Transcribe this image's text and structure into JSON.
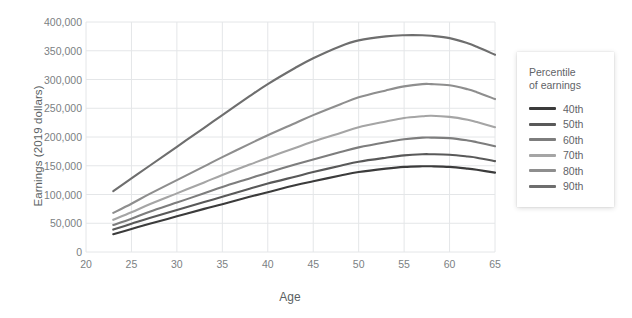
{
  "chart_data": {
    "type": "line",
    "title": "",
    "xlabel": "Age",
    "ylabel": "Earnings (2019 dollars)",
    "xlim": [
      20,
      65
    ],
    "ylim": [
      0,
      400000
    ],
    "xticks": [
      20,
      25,
      30,
      35,
      40,
      45,
      50,
      55,
      60,
      65
    ],
    "yticks": [
      0,
      50000,
      100000,
      150000,
      200000,
      250000,
      300000,
      350000,
      400000
    ],
    "ytick_labels": [
      "0",
      "50,000",
      "100,000",
      "150,000",
      "200,000",
      "250,000",
      "300,000",
      "350,000",
      "400,000"
    ],
    "xtick_labels": [
      "20",
      "25",
      "30",
      "35",
      "40",
      "45",
      "50",
      "55",
      "60",
      "65"
    ],
    "grid": true,
    "legend_position": "right",
    "legend_title": "Percentile of earnings",
    "x": [
      23,
      25,
      27,
      30,
      33,
      35,
      38,
      40,
      43,
      45,
      48,
      50,
      53,
      55,
      57,
      58,
      60,
      62,
      63,
      65
    ],
    "series": [
      {
        "name": "40th",
        "color": "#3b3b3b",
        "values": [
          31000,
          40000,
          49000,
          62000,
          75000,
          83000,
          96000,
          104000,
          116000,
          123000,
          133000,
          139000,
          145000,
          148000,
          149000,
          149000,
          148000,
          145000,
          143000,
          138000
        ]
      },
      {
        "name": "50th",
        "color": "#595959",
        "values": [
          39000,
          49000,
          59000,
          73000,
          87000,
          96000,
          110000,
          119000,
          131000,
          139000,
          150000,
          157000,
          164000,
          168000,
          170000,
          170000,
          169000,
          166000,
          164000,
          158000
        ]
      },
      {
        "name": "60th",
        "color": "#7d7d7d",
        "values": [
          47000,
          58000,
          70000,
          86000,
          102000,
          113000,
          128000,
          138000,
          152000,
          161000,
          174000,
          182000,
          191000,
          196000,
          199000,
          199000,
          198000,
          194000,
          191000,
          184000
        ]
      },
      {
        "name": "70th",
        "color": "#a5a5a5",
        "values": [
          56000,
          69000,
          83000,
          102000,
          121000,
          134000,
          152000,
          164000,
          181000,
          192000,
          207000,
          217000,
          227000,
          233000,
          236000,
          237000,
          235000,
          230000,
          226000,
          217000
        ]
      },
      {
        "name": "80th",
        "color": "#8e8e8e",
        "values": [
          68000,
          84000,
          101000,
          125000,
          149000,
          165000,
          188000,
          203000,
          224000,
          238000,
          257000,
          269000,
          281000,
          288000,
          292000,
          292000,
          290000,
          283000,
          278000,
          266000
        ]
      },
      {
        "name": "90th",
        "color": "#6e6e6e",
        "values": [
          106000,
          128000,
          150000,
          183000,
          216000,
          238000,
          271000,
          292000,
          320000,
          337000,
          358000,
          368000,
          375000,
          377000,
          377000,
          376000,
          372000,
          363000,
          357000,
          343000
        ]
      }
    ]
  },
  "legend": {
    "title_line1": "Percentile",
    "title_line2": "of earnings",
    "entries": [
      {
        "label": "40th",
        "color": "#3b3b3b"
      },
      {
        "label": "50th",
        "color": "#595959"
      },
      {
        "label": "60th",
        "color": "#7d7d7d"
      },
      {
        "label": "70th",
        "color": "#a5a5a5"
      },
      {
        "label": "80th",
        "color": "#8e8e8e"
      },
      {
        "label": "90th",
        "color": "#6e6e6e"
      }
    ]
  },
  "colors": {
    "background": "#ffffff",
    "grid": "#e4e6e8",
    "axis_text": "#7b7f83",
    "label_text": "#5a5f63"
  }
}
